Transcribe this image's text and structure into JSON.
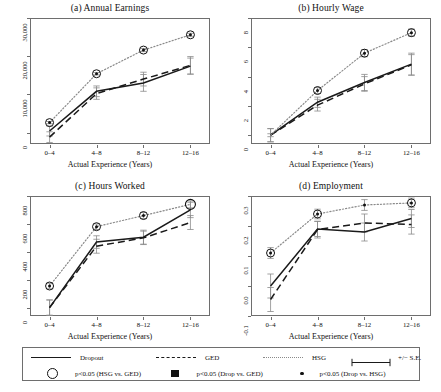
{
  "figure": {
    "xlabel": "Actual Experience (Years)",
    "xticks": [
      "0–4",
      "4–8",
      "8–12",
      "12–16"
    ]
  },
  "legend": {
    "items": [
      {
        "marker": "solid-line",
        "label": "Dropout"
      },
      {
        "marker": "dashed-line",
        "label": "GED"
      },
      {
        "marker": "dotted-line",
        "label": "HSG"
      },
      {
        "marker": "error-bar",
        "label": "+/− S.E."
      },
      {
        "marker": "open-circle",
        "label": "p<0.05 (HSG vs. GED)"
      },
      {
        "marker": "filled-square",
        "label": "p<0.05 (Drop vs. GED)"
      },
      {
        "marker": "small-dot",
        "label": "p<0.05 (Drop vs. HSG)"
      }
    ]
  },
  "colors": {
    "dropout": "#1a1a1a",
    "ged": "#1a1a1a",
    "hsg": "#8a8a8a",
    "axis": "#6e6e6e",
    "errorbar": "#8a8a8a"
  },
  "chart_data": [
    {
      "id": "panel-a",
      "type": "line",
      "title": "(a) Annual Earnings",
      "xlabel": "Actual Experience (Years)",
      "ylabel": "",
      "categories": [
        "0–4",
        "4–8",
        "8–12",
        "12–16"
      ],
      "ylim": [
        -3000,
        30000
      ],
      "yticks": [
        0,
        10000,
        20000,
        30000
      ],
      "ytick_labels": [
        "0",
        "10,000",
        "20,000",
        "30,000"
      ],
      "grid": false,
      "series": [
        {
          "name": "Dropout",
          "style": "solid",
          "values": [
            400,
            10800,
            13000,
            17400
          ],
          "se": [
            1300,
            1400,
            2200,
            2100
          ]
        },
        {
          "name": "GED",
          "style": "dashed",
          "values": [
            -1200,
            10200,
            14000,
            17600
          ],
          "se": [
            1400,
            1500,
            1800,
            2300
          ]
        },
        {
          "name": "HSG",
          "style": "dotted",
          "values": [
            2600,
            15400,
            21600,
            25600
          ],
          "se": [
            300,
            300,
            400,
            400
          ]
        }
      ],
      "sig_markers": [
        {
          "x": "0–4",
          "value": 2600,
          "type": "open-circle"
        },
        {
          "x": "0–4",
          "value": 2600,
          "type": "small-dot"
        },
        {
          "x": "4–8",
          "value": 15400,
          "type": "open-circle"
        },
        {
          "x": "4–8",
          "value": 15400,
          "type": "small-dot"
        },
        {
          "x": "8–12",
          "value": 21600,
          "type": "open-circle"
        },
        {
          "x": "8–12",
          "value": 21600,
          "type": "small-dot"
        },
        {
          "x": "12–16",
          "value": 25600,
          "type": "open-circle"
        },
        {
          "x": "12–16",
          "value": 25600,
          "type": "small-dot"
        }
      ]
    },
    {
      "id": "panel-b",
      "type": "line",
      "title": "(b) Hourly Wage",
      "xlabel": "Actual Experience (Years)",
      "ylabel": "",
      "categories": [
        "0–4",
        "4–8",
        "8–12",
        "12–16"
      ],
      "ylim": [
        -0.6,
        8.0
      ],
      "yticks": [
        0,
        2,
        4,
        6,
        8
      ],
      "ytick_labels": [
        "0",
        "2",
        "4",
        "6",
        "8"
      ],
      "grid": false,
      "series": [
        {
          "name": "Dropout",
          "style": "solid",
          "values": [
            0.0,
            2.25,
            3.6,
            4.85
          ],
          "se": [
            0.45,
            0.35,
            0.55,
            0.75
          ]
        },
        {
          "name": "GED",
          "style": "dashed",
          "values": [
            0.0,
            2.05,
            3.5,
            4.8
          ],
          "se": [
            0.45,
            0.4,
            0.5,
            0.7
          ]
        },
        {
          "name": "HSG",
          "style": "dotted",
          "values": [
            0.0,
            3.05,
            5.6,
            7.0
          ],
          "se": [
            0.1,
            0.2,
            0.25,
            0.25
          ]
        }
      ],
      "sig_markers": [
        {
          "x": "4–8",
          "value": 3.05,
          "type": "open-circle"
        },
        {
          "x": "4–8",
          "value": 3.05,
          "type": "small-dot"
        },
        {
          "x": "8–12",
          "value": 5.6,
          "type": "open-circle"
        },
        {
          "x": "8–12",
          "value": 5.6,
          "type": "small-dot"
        },
        {
          "x": "12–16",
          "value": 7.0,
          "type": "open-circle"
        },
        {
          "x": "12–16",
          "value": 7.0,
          "type": "small-dot"
        }
      ]
    },
    {
      "id": "panel-c",
      "type": "line",
      "title": "(c) Hours Worked",
      "xlabel": "Actual Experience (Years)",
      "ylabel": "",
      "categories": [
        "0–4",
        "4–8",
        "8–12",
        "12–16"
      ],
      "ylim": [
        -60,
        800
      ],
      "yticks": [
        0,
        200,
        400,
        600,
        800
      ],
      "ytick_labels": [
        "0",
        "200",
        "400",
        "600",
        "800"
      ],
      "grid": false,
      "series": [
        {
          "name": "Dropout",
          "style": "solid",
          "values": [
            0,
            470,
            505,
            700
          ],
          "se": [
            55,
            45,
            50,
            55
          ]
        },
        {
          "name": "GED",
          "style": "dashed",
          "values": [
            0,
            440,
            500,
            610
          ],
          "se": [
            55,
            50,
            48,
            50
          ]
        },
        {
          "name": "HSG",
          "style": "dotted",
          "values": [
            155,
            580,
            660,
            740
          ],
          "se": [
            20,
            20,
            22,
            25
          ]
        }
      ],
      "sig_markers": [
        {
          "x": "0–4",
          "value": 155,
          "type": "open-circle"
        },
        {
          "x": "0–4",
          "value": 155,
          "type": "small-dot"
        },
        {
          "x": "4–8",
          "value": 580,
          "type": "open-circle"
        },
        {
          "x": "4–8",
          "value": 580,
          "type": "small-dot"
        },
        {
          "x": "8–12",
          "value": 660,
          "type": "open-circle"
        },
        {
          "x": "8–12",
          "value": 660,
          "type": "small-dot"
        },
        {
          "x": "12–16",
          "value": 740,
          "type": "open-circle-large"
        }
      ]
    },
    {
      "id": "panel-d",
      "type": "line",
      "title": "(d) Employment",
      "xlabel": "Actual Experience (Years)",
      "ylabel": "",
      "categories": [
        "0–4",
        "4–8",
        "8–12",
        "12–16"
      ],
      "ylim": [
        -0.1,
        0.3
      ],
      "yticks": [
        -0.1,
        0.0,
        0.1,
        0.2,
        0.3
      ],
      "ytick_labels": [
        "-0.1",
        "0.0",
        "0.1",
        "0.2",
        "0.3"
      ],
      "grid": false,
      "series": [
        {
          "name": "Dropout",
          "style": "solid",
          "values": [
            0.0,
            0.19,
            0.18,
            0.225
          ],
          "se": [
            0.04,
            0.025,
            0.03,
            0.03
          ]
        },
        {
          "name": "GED",
          "style": "dashed",
          "values": [
            -0.045,
            0.188,
            0.21,
            0.205
          ],
          "se": [
            0.04,
            0.028,
            0.03,
            0.032
          ]
        },
        {
          "name": "HSG",
          "style": "dotted",
          "values": [
            0.11,
            0.24,
            0.27,
            0.277
          ],
          "se": [
            0.018,
            0.016,
            0.018,
            0.016
          ]
        }
      ],
      "sig_markers": [
        {
          "x": "0–4",
          "value": 0.11,
          "type": "open-circle"
        },
        {
          "x": "0–4",
          "value": 0.11,
          "type": "small-dot"
        },
        {
          "x": "4–8",
          "value": 0.24,
          "type": "open-circle"
        },
        {
          "x": "4–8",
          "value": 0.24,
          "type": "small-dot"
        },
        {
          "x": "8–12",
          "value": 0.27,
          "type": "small-dot"
        },
        {
          "x": "12–16",
          "value": 0.277,
          "type": "open-circle"
        },
        {
          "x": "12–16",
          "value": 0.277,
          "type": "small-dot"
        }
      ]
    }
  ]
}
